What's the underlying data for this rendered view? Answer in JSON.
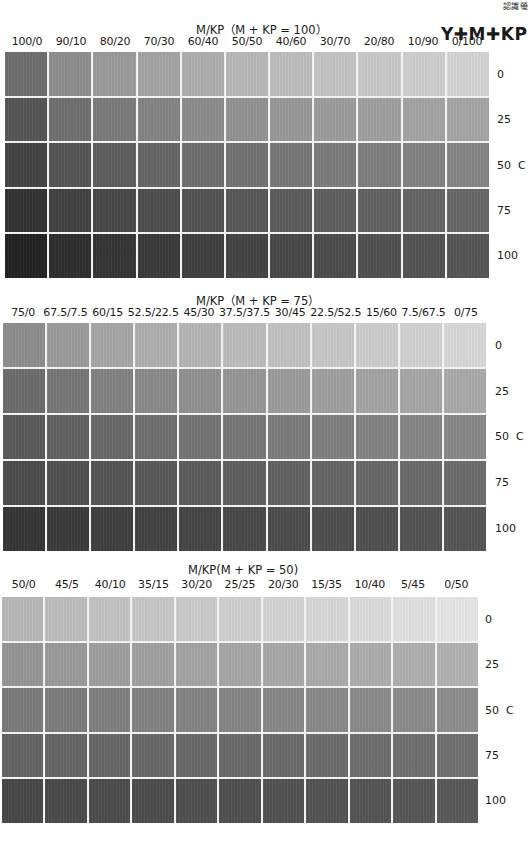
{
  "corner_label": "認識螢",
  "brand": "Y✚M✚KP",
  "chart_data": [
    {
      "type": "heatmap",
      "title": "M/KP（M + KP = 100）",
      "columns": [
        "100/0",
        "90/10",
        "80/20",
        "70/30",
        "60/40",
        "50/50",
        "40/60",
        "30/70",
        "20/80",
        "10/90",
        "0/100"
      ],
      "rows": [
        "0",
        "25",
        "50  C",
        "75",
        "100"
      ],
      "row_axis_label": "C",
      "cells": [
        [
          "#6e6e6e",
          "#8e8e8e",
          "#9a9a9a",
          "#a4a4a4",
          "#aeaeae",
          "#b8b8b8",
          "#bebebe",
          "#c4c4c4",
          "#c9c9c9",
          "#cecece",
          "#d4d4d4"
        ],
        [
          "#555555",
          "#707070",
          "#7a7a7a",
          "#848484",
          "#8c8c8c",
          "#939393",
          "#989898",
          "#9c9c9c",
          "#a0a0a0",
          "#a3a3a3",
          "#a6a6a6"
        ],
        [
          "#444444",
          "#555555",
          "#5e5e5e",
          "#666666",
          "#6e6e6e",
          "#737373",
          "#787878",
          "#7c7c7c",
          "#7f7f7f",
          "#828282",
          "#858585"
        ],
        [
          "#333333",
          "#424242",
          "#484848",
          "#4e4e4e",
          "#545454",
          "#585858",
          "#5c5c5c",
          "#5f5f5f",
          "#626262",
          "#656565",
          "#676767"
        ],
        [
          "#222222",
          "#2e2e2e",
          "#353535",
          "#3b3b3b",
          "#404040",
          "#444444",
          "#484848",
          "#4c4c4c",
          "#505050",
          "#535353",
          "#565656"
        ]
      ]
    },
    {
      "type": "heatmap",
      "title": "M/KP（M + KP = 75）",
      "columns": [
        "75/0",
        "67.5/7.5",
        "60/15",
        "52.5/22.5",
        "45/30",
        "37.5/37.5",
        "30/45",
        "22.5/52.5",
        "15/60",
        "7.5/67.5",
        "0/75"
      ],
      "rows": [
        "0",
        "25",
        "50  C",
        "75",
        "100"
      ],
      "row_axis_label": "C",
      "cells": [
        [
          "#8e8e8e",
          "#9c9c9c",
          "#a6a6a6",
          "#afafaf",
          "#b6b6b6",
          "#bcbcbc",
          "#c2c2c2",
          "#c8c8c8",
          "#cdcdcd",
          "#d2d2d2",
          "#d8d8d8"
        ],
        [
          "#6c6c6c",
          "#787878",
          "#828282",
          "#8a8a8a",
          "#919191",
          "#979797",
          "#9c9c9c",
          "#a0a0a0",
          "#a4a4a4",
          "#a7a7a7",
          "#aaaaaa"
        ],
        [
          "#5a5a5a",
          "#626262",
          "#696969",
          "#6f6f6f",
          "#747474",
          "#787878",
          "#7c7c7c",
          "#808080",
          "#838383",
          "#868686",
          "#888888"
        ],
        [
          "#4c4c4c",
          "#515151",
          "#555555",
          "#595959",
          "#5c5c5c",
          "#5f5f5f",
          "#626262",
          "#656565",
          "#686868",
          "#6a6a6a",
          "#6c6c6c"
        ],
        [
          "#363636",
          "#3b3b3b",
          "#3f3f3f",
          "#434343",
          "#464646",
          "#494949",
          "#4c4c4c",
          "#4e4e4e",
          "#505050",
          "#535353",
          "#555555"
        ]
      ]
    },
    {
      "type": "heatmap",
      "title": "M/KP(M + KP = 50)",
      "columns": [
        "50/0",
        "45/5",
        "40/10",
        "35/15",
        "30/20",
        "25/25",
        "20/30",
        "15/35",
        "10/40",
        "5/45",
        "0/50"
      ],
      "rows": [
        "0",
        "25",
        "50  C",
        "75",
        "100"
      ],
      "row_axis_label": "C",
      "cells": [
        [
          "#b8b8b8",
          "#bebebe",
          "#c3c3c3",
          "#c8c8c8",
          "#cccccc",
          "#d0d0d0",
          "#d4d4d4",
          "#d8d8d8",
          "#dcdcdc",
          "#e1e1e1",
          "#e6e6e6"
        ],
        [
          "#969696",
          "#9a9a9a",
          "#9e9e9e",
          "#a1a1a1",
          "#a4a4a4",
          "#a7a7a7",
          "#a9a9a9",
          "#abababab",
          "#adadad",
          "#afafaf",
          "#b2b2b2"
        ],
        [
          "#7a7a7a",
          "#7d7d7d",
          "#808080",
          "#828282",
          "#848484",
          "#868686",
          "#888888",
          "#898989",
          "#8b8b8b",
          "#8c8c8c",
          "#8e8e8e"
        ],
        [
          "#646464",
          "#666666",
          "#676767",
          "#686868",
          "#696969",
          "#6a6a6a",
          "#6b6b6b",
          "#6c6c6c",
          "#6e6e6e",
          "#6f6f6f",
          "#717171"
        ],
        [
          "#484848",
          "#4a4a4a",
          "#4c4c4c",
          "#4d4d4d",
          "#4f4f4f",
          "#505050",
          "#525252",
          "#535353",
          "#555555",
          "#575757",
          "#595959"
        ]
      ]
    }
  ]
}
